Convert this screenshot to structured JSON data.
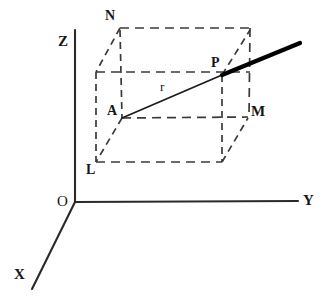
{
  "figure": {
    "background_color": "#ffffff",
    "ink_color": "#1c1c1c",
    "dash_color": "#3a3a3a"
  },
  "axes": {
    "labels": {
      "x": "X",
      "y": "Y",
      "z": "Z",
      "origin": "O"
    },
    "origin_point": {
      "x": 75,
      "y": 202
    },
    "z_axis": {
      "x1": 75,
      "y1": 30,
      "x2": 75,
      "y2": 202
    },
    "y_axis": {
      "x1": 75,
      "y1": 202,
      "x2": 298,
      "y2": 201
    },
    "x_axis": {
      "x1": 75,
      "y1": 202,
      "x2": 32,
      "y2": 289
    }
  },
  "vertices": [
    {
      "name": "N",
      "label": "N",
      "x": 120,
      "y": 28,
      "label_x": 105,
      "label_y": 9,
      "style": "normal"
    },
    {
      "name": "P",
      "label": "P",
      "x": 222,
      "y": 75,
      "label_x": 211,
      "label_y": 56,
      "style": "normal"
    },
    {
      "name": "A",
      "label": "A",
      "x": 122,
      "y": 118,
      "label_x": 107,
      "label_y": 104,
      "style": "normal"
    },
    {
      "name": "M",
      "label": "M",
      "x": 248,
      "y": 117,
      "label_x": 251,
      "label_y": 104,
      "style": "bold"
    },
    {
      "name": "L",
      "label": "L",
      "x": 96,
      "y": 162,
      "label_x": 86,
      "label_y": 163,
      "style": "normal"
    }
  ],
  "measures": [
    {
      "name": "radius",
      "label": "r",
      "label_x": 160,
      "label_y": 80
    }
  ],
  "box_edges": [
    {
      "name": "top-back-edge",
      "x1": 120,
      "y1": 28,
      "x2": 250,
      "y2": 28
    },
    {
      "name": "right-back-vertical",
      "x1": 250,
      "y1": 28,
      "x2": 249,
      "y2": 117
    },
    {
      "name": "left-front-vertical",
      "x1": 120,
      "y1": 30,
      "x2": 122,
      "y2": 118
    },
    {
      "name": "n-to-upper-left-diagonal",
      "x1": 120,
      "y1": 28,
      "x2": 96,
      "y2": 72
    },
    {
      "name": "left-side-vertical",
      "x1": 96,
      "y1": 72,
      "x2": 96,
      "y2": 162
    },
    {
      "name": "mid-horizontal-edge",
      "x1": 96,
      "y1": 72,
      "x2": 250,
      "y2": 72
    },
    {
      "name": "p-to-back-top-diagonal",
      "x1": 222,
      "y1": 75,
      "x2": 250,
      "y2": 30
    },
    {
      "name": "p-vertical-drop",
      "x1": 222,
      "y1": 75,
      "x2": 222,
      "y2": 162
    },
    {
      "name": "a-to-m-horizontal",
      "x1": 122,
      "y1": 118,
      "x2": 248,
      "y2": 117
    },
    {
      "name": "a-to-l-diagonal",
      "x1": 122,
      "y1": 118,
      "x2": 96,
      "y2": 162
    },
    {
      "name": "bottom-front-edge",
      "x1": 96,
      "y1": 162,
      "x2": 222,
      "y2": 162
    },
    {
      "name": "bottom-right-to-m-diagonal",
      "x1": 222,
      "y1": 162,
      "x2": 248,
      "y2": 118
    }
  ],
  "vectors": [
    {
      "name": "radius-segment-a-to-p",
      "x1": 122,
      "y1": 118,
      "x2": 222,
      "y2": 75,
      "weight": "thin"
    },
    {
      "name": "ray-extension-p-outward",
      "x1": 222,
      "y1": 75,
      "x2": 300,
      "y2": 43,
      "weight": "thick"
    }
  ]
}
